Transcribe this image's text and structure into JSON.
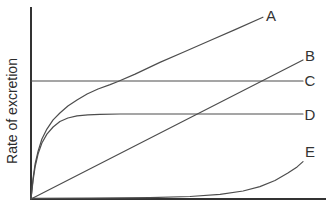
{
  "colors": {
    "background": "#ffffff",
    "axis": "#333333",
    "curve": "#4d4d4d",
    "label": "#333333"
  },
  "chart_data": {
    "type": "line",
    "title": "",
    "xlabel": "",
    "ylabel": "Rate of excretion",
    "x_ticks": [],
    "y_ticks": [],
    "axis_note": "axes have no tick marks or numeric labels; point values normalized 0-100",
    "xlim": [
      0,
      100
    ],
    "ylim": [
      0,
      100
    ],
    "legend_position": "labels at right end of each curve",
    "grid": false,
    "series": [
      {
        "name": "A",
        "label": "A",
        "shape": "steep saturating rise then straight linear increase to top right",
        "points": [
          [
            0,
            0
          ],
          [
            0.7,
            11.0
          ],
          [
            1.4,
            18.3
          ],
          [
            2.4,
            25.1
          ],
          [
            3.7,
            31.4
          ],
          [
            5.4,
            36.6
          ],
          [
            7.5,
            41.4
          ],
          [
            9.8,
            45.0
          ],
          [
            12.5,
            48.7
          ],
          [
            15.6,
            51.8
          ],
          [
            19.0,
            55.0
          ],
          [
            22.7,
            57.6
          ],
          [
            26.8,
            59.9
          ],
          [
            29.5,
            61.5
          ],
          [
            35.3,
            65.4
          ],
          [
            43.7,
            71.5
          ],
          [
            52.2,
            77.2
          ],
          [
            60.7,
            83.0
          ],
          [
            69.2,
            88.7
          ],
          [
            78.6,
            95.2
          ]
        ]
      },
      {
        "name": "B",
        "label": "B",
        "shape": "straight line from origin",
        "points": [
          [
            0,
            0
          ],
          [
            92.2,
            72.8
          ]
        ]
      },
      {
        "name": "C",
        "label": "C",
        "shape": "horizontal line",
        "points": [
          [
            0,
            61.8
          ],
          [
            92.2,
            61.8
          ]
        ]
      },
      {
        "name": "D",
        "label": "D",
        "shape": "steep saturating rise to low plateau",
        "points": [
          [
            0,
            0
          ],
          [
            0.7,
            9.9
          ],
          [
            1.4,
            16.8
          ],
          [
            2.4,
            23.6
          ],
          [
            3.7,
            29.3
          ],
          [
            5.4,
            34.0
          ],
          [
            7.5,
            37.7
          ],
          [
            9.8,
            40.6
          ],
          [
            12.5,
            42.4
          ],
          [
            15.6,
            43.5
          ],
          [
            19.3,
            44.1
          ],
          [
            23.4,
            44.3
          ],
          [
            30.2,
            44.5
          ],
          [
            92.2,
            44.5
          ]
        ]
      },
      {
        "name": "E",
        "label": "E",
        "shape": "hugs baseline then accelerating late rise",
        "points": [
          [
            0,
            0.3
          ],
          [
            20.0,
            0.4
          ],
          [
            40.3,
            0.7
          ],
          [
            53.9,
            1.3
          ],
          [
            64.1,
            2.4
          ],
          [
            71.9,
            4.2
          ],
          [
            77.6,
            6.5
          ],
          [
            82.7,
            9.7
          ],
          [
            87.1,
            13.6
          ],
          [
            90.2,
            16.8
          ],
          [
            92.2,
            19.6
          ]
        ]
      }
    ]
  }
}
